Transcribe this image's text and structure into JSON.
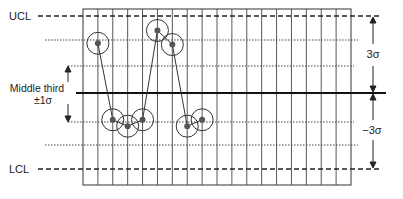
{
  "chart_data": {
    "type": "line",
    "labels": {
      "ucl": "UCL",
      "lcl": "LCL",
      "middle_third_line1": "Middle third",
      "middle_third_line2": "±1σ",
      "upper_span": "3σ",
      "lower_span": "−3σ"
    },
    "grid": {
      "columns": 18,
      "vertical_lines": true
    },
    "levels": {
      "ucl": 3,
      "upper_two_thirds": 2,
      "upper_one_third": 1,
      "center": 0,
      "lower_one_third": -1,
      "lower_two_thirds": -2,
      "lcl": -3
    },
    "points": [
      {
        "x": 1,
        "y": 1.95
      },
      {
        "x": 2,
        "y": -1.05
      },
      {
        "x": 3,
        "y": -1.3
      },
      {
        "x": 4,
        "y": -1.05
      },
      {
        "x": 5,
        "y": 2.45
      },
      {
        "x": 6,
        "y": 1.9
      },
      {
        "x": 7,
        "y": -1.3
      },
      {
        "x": 8,
        "y": -1.05
      }
    ],
    "circled_points": true
  }
}
